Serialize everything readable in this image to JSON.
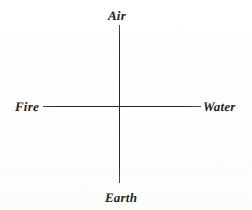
{
  "figure": {
    "kind": "axis-diagram",
    "background_color": "#fefefe",
    "ink_color": "#232323"
  },
  "chart_data": {
    "type": "scatter",
    "title": "",
    "xlabel": "",
    "ylabel": "",
    "grid": false,
    "legend": null,
    "axes": {
      "vertical": {
        "positive_end_label": "Air",
        "negative_end_label": "Earth"
      },
      "horizontal": {
        "negative_end_label": "Fire",
        "positive_end_label": "Water"
      }
    },
    "annotations": [
      {
        "label": "Air",
        "position": "top",
        "x": 0,
        "y": 1
      },
      {
        "label": "Earth",
        "position": "bottom",
        "x": 0,
        "y": -1
      },
      {
        "label": "Fire",
        "position": "left",
        "x": -1,
        "y": 0
      },
      {
        "label": "Water",
        "position": "right",
        "x": 1,
        "y": 0
      }
    ]
  },
  "labels": {
    "air": "Air",
    "earth": "Earth",
    "fire": "Fire",
    "water": "Water"
  }
}
